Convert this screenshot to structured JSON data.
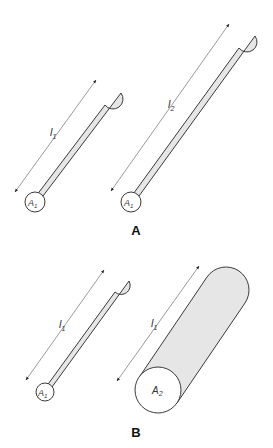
{
  "figure": {
    "panels": [
      {
        "label": "A",
        "cylinders": [
          {
            "id": "A-left",
            "length_label": "l",
            "length_sub": "1",
            "area_label": "A",
            "area_sub": "1"
          },
          {
            "id": "A-right",
            "length_label": "l",
            "length_sub": "2",
            "area_label": "A",
            "area_sub": "1"
          }
        ]
      },
      {
        "label": "B",
        "cylinders": [
          {
            "id": "B-left",
            "length_label": "l",
            "length_sub": "1",
            "area_label": "A",
            "area_sub": "1"
          },
          {
            "id": "B-right",
            "length_label": "l",
            "length_sub": "1",
            "area_label": "A",
            "area_sub": "2"
          }
        ]
      }
    ],
    "colors": {
      "cylinder_fill": "#e6e6e6",
      "outline": "#3a3a3a",
      "end_face": "#ffffff"
    }
  }
}
